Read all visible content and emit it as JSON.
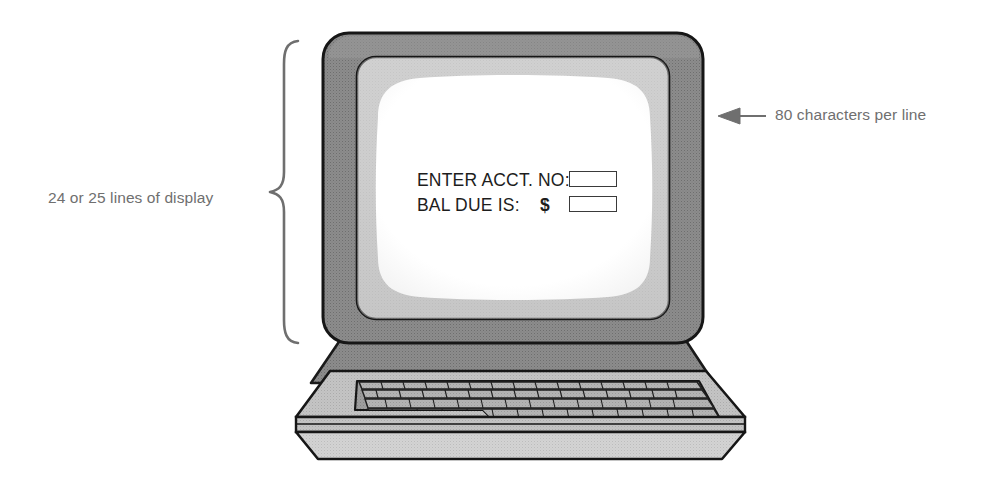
{
  "diagram": {
    "annotations": [
      {
        "id": "lines-annotation",
        "text": "24 or 25 lines of display",
        "marker": "curly-brace",
        "position": "left"
      },
      {
        "id": "chars-annotation",
        "text": "80 characters per line",
        "marker": "left-arrow",
        "position": "right"
      }
    ],
    "screen": {
      "rows": [
        {
          "label": "ENTER ACCT. NO:",
          "currency": "",
          "field_value": ""
        },
        {
          "label": "BAL DUE IS:",
          "currency": "$",
          "field_value": ""
        }
      ]
    },
    "colors": {
      "bezel_outer": "#8c8c8c",
      "bezel_inner": "#b9b9b9",
      "screen": "#ffffff",
      "case": "#c6c6c6",
      "keys": "#b0b0b0",
      "outline": "#1a1a1a",
      "annotation_text": "#6f6f6f",
      "screen_text": "#1d1d1d"
    }
  }
}
